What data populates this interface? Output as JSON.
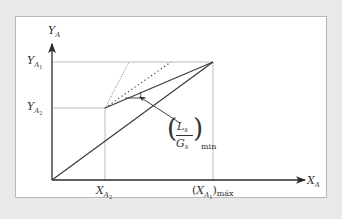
{
  "diagram": {
    "type": "operating-line diagram (absorption, minimum L/G)",
    "colors": {
      "background": "#e9e9e9",
      "panel": "#ffffff",
      "panel_border": "#b8b8b8",
      "line": "#3a3a3a",
      "guide": "#9a9a9a"
    },
    "axes": {
      "y_label": {
        "main": "Y",
        "sub": "A"
      },
      "x_label": {
        "main": "X",
        "sub": "A"
      }
    },
    "y_ticks": [
      {
        "main": "Y",
        "sub": "A",
        "subsub": "1"
      },
      {
        "main": "Y",
        "sub": "A",
        "subsub": "2"
      }
    ],
    "x_ticks": [
      {
        "main": "X",
        "sub": "A",
        "subsub": "2"
      },
      {
        "open": "(",
        "main": "X",
        "sub": "A",
        "subsub": "1",
        "close": ")",
        "suffix": "máx"
      }
    ],
    "annotation": {
      "numerator": {
        "main": "L",
        "sub": "s"
      },
      "denominator": {
        "main": "G",
        "sub": "s"
      },
      "subscript": "min"
    },
    "lines": [
      {
        "name": "equilibrium-line",
        "style": "solid",
        "from": [
          52,
          180
        ],
        "to": [
          213,
          62
        ]
      },
      {
        "name": "min-operating-line",
        "style": "solid",
        "from": [
          105,
          108
        ],
        "to": [
          213,
          62
        ]
      },
      {
        "name": "operating-line-dense-dotted",
        "style": "dotted-fine",
        "from": [
          105,
          108
        ],
        "to": [
          129,
          62
        ]
      },
      {
        "name": "operating-line-coarse-dotted",
        "style": "dotted-coarse",
        "from": [
          105,
          108
        ],
        "to": [
          171,
          62
        ]
      }
    ],
    "points": {
      "origin": [
        52,
        180
      ],
      "y_a1": 62,
      "y_a2": 108,
      "x_a2": 105,
      "x_a1_max": 213
    }
  }
}
